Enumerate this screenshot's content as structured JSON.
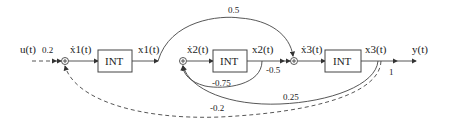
{
  "diagram": {
    "input": {
      "label": "u(t)",
      "gain": "0.2"
    },
    "output": {
      "label": "y(t)",
      "gain": "1"
    },
    "blocks": [
      {
        "label": "INT",
        "in": "ẋ1(t)",
        "out": "x1(t)"
      },
      {
        "label": "INT",
        "in": "ẋ2(t)",
        "out": "x2(t)"
      },
      {
        "label": "INT",
        "in": "ẋ3(t)",
        "out": "x3(t)"
      }
    ],
    "gains": {
      "x1_to_sum3": "0.5",
      "x2_to_sum3": "-0.5",
      "x2_to_sum2": "-0.75",
      "x3_to_sum2": "0.25",
      "x3_to_sum1": "-0.2"
    },
    "colors": {
      "line": "#444444",
      "text": "#222222",
      "background": "#ffffff"
    }
  }
}
